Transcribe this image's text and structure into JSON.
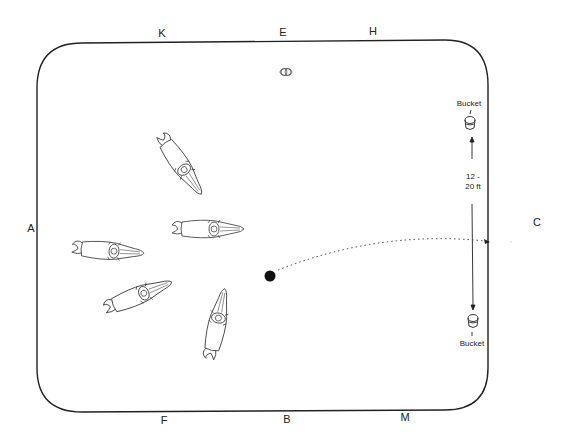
{
  "arena": {
    "letters": {
      "K": "K",
      "E": "E",
      "H": "H",
      "A": "A",
      "C": "C",
      "F": "F",
      "B": "B",
      "M": "M"
    }
  },
  "buckets": {
    "top_label": "Bucket",
    "bottom_label": "Bucket",
    "distance_label_line1": "12 -",
    "distance_label_line2": "20 ft"
  },
  "colors": {
    "line": "#222222",
    "background": "#ffffff"
  },
  "horses": {
    "count": 5
  }
}
